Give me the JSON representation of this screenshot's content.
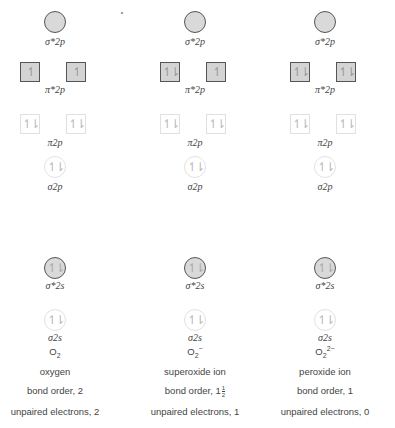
{
  "diagram": {
    "type": "molecular-orbital-occupancy",
    "orbital_labels": {
      "sigma_star_2p": "σ*2p",
      "pi_star_2p": "π*2p",
      "pi_2p": "π2p",
      "sigma_2p": "σ2p",
      "sigma_star_2s": "σ*2s",
      "sigma_2s": "σ2s"
    },
    "spin_glyphs": {
      "up": "↿",
      "pair": "↿⇂"
    },
    "columns": [
      {
        "species_base": "O",
        "species_sub": "2",
        "species_charge": "",
        "name": "oxygen",
        "bond_order_label": "bond order, 2",
        "bond_order_whole": "",
        "bond_order_frac": null,
        "unpaired_label": "unpaired electrons, 2",
        "orbitals": {
          "sigma_star_2p": "",
          "pi_star_2p": [
            "↿",
            "↿"
          ],
          "pi_2p": [
            "↿⇂",
            "↿⇂"
          ],
          "sigma_2p": "↿⇂",
          "sigma_star_2s": "↿⇂",
          "sigma_2s": "↿⇂"
        }
      },
      {
        "species_base": "O",
        "species_sub": "2",
        "species_charge": "−",
        "name": "superoxide ion",
        "bond_order_label": "bond order, 1",
        "bond_order_frac": {
          "num": "1",
          "den": "2"
        },
        "unpaired_label": "unpaired electrons, 1",
        "orbitals": {
          "sigma_star_2p": "",
          "pi_star_2p": [
            "↿⇂",
            "↿"
          ],
          "pi_2p": [
            "↿⇂",
            "↿⇂"
          ],
          "sigma_2p": "↿⇂",
          "sigma_star_2s": "↿⇂",
          "sigma_2s": "↿⇂"
        }
      },
      {
        "species_base": "O",
        "species_sub": "2",
        "species_charge": "2−",
        "name": "peroxide ion",
        "bond_order_label": "bond order, 1",
        "bond_order_frac": null,
        "unpaired_label": "unpaired electrons, 0",
        "orbitals": {
          "sigma_star_2p": "",
          "pi_star_2p": [
            "↿⇂",
            "↿⇂"
          ],
          "pi_2p": [
            "↿⇂",
            "↿⇂"
          ],
          "sigma_2p": "↿⇂",
          "sigma_star_2s": "↿⇂",
          "sigma_2s": "↿⇂"
        }
      }
    ],
    "colors": {
      "filled_orbital": "#d4d4d4",
      "outline": "#555555",
      "faint_outline": "#e0e0e0",
      "text": "#444444"
    }
  }
}
